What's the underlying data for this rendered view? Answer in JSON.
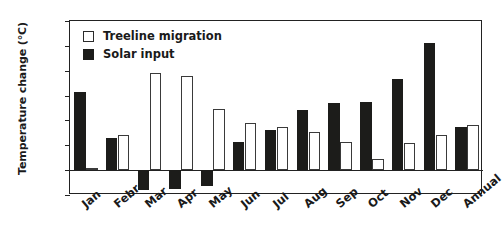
{
  "chart_data": {
    "type": "bar",
    "title": "",
    "xlabel": "",
    "ylabel": "Temperature change (°C)",
    "ylim": [
      -1,
      6
    ],
    "yticks": [
      -1,
      0,
      1,
      2,
      3,
      4,
      5,
      6
    ],
    "ytick_labels": [
      "-1",
      "0",
      "1",
      "2",
      "3",
      "4",
      "5",
      "6"
    ],
    "grid": false,
    "legend_position": "top-left",
    "categories": [
      "Jan",
      "Febr",
      "Mar",
      "Apr",
      "May",
      "Jun",
      "Jul",
      "Aug",
      "Sep",
      "Oct",
      "Nov",
      "Dec",
      "Annual"
    ],
    "series": [
      {
        "name": "Solar input",
        "color": "#1c1c1a",
        "style": "filled",
        "values": [
          3.15,
          1.3,
          -0.8,
          -0.75,
          -0.65,
          1.15,
          1.6,
          2.4,
          2.7,
          2.75,
          3.65,
          5.1,
          1.75
        ]
      },
      {
        "name": "Treeline migration",
        "color": "#ffffff",
        "style": "open",
        "values": [
          0.1,
          1.4,
          3.9,
          3.8,
          2.45,
          1.9,
          1.75,
          1.55,
          1.15,
          0.45,
          1.1,
          1.4,
          1.8
        ]
      }
    ]
  },
  "legend": {
    "items": [
      {
        "label": "Treeline migration",
        "style": "open"
      },
      {
        "label": "Solar input",
        "style": "filled"
      }
    ]
  },
  "axis": {
    "y_title": "Temperature change (°C)"
  }
}
